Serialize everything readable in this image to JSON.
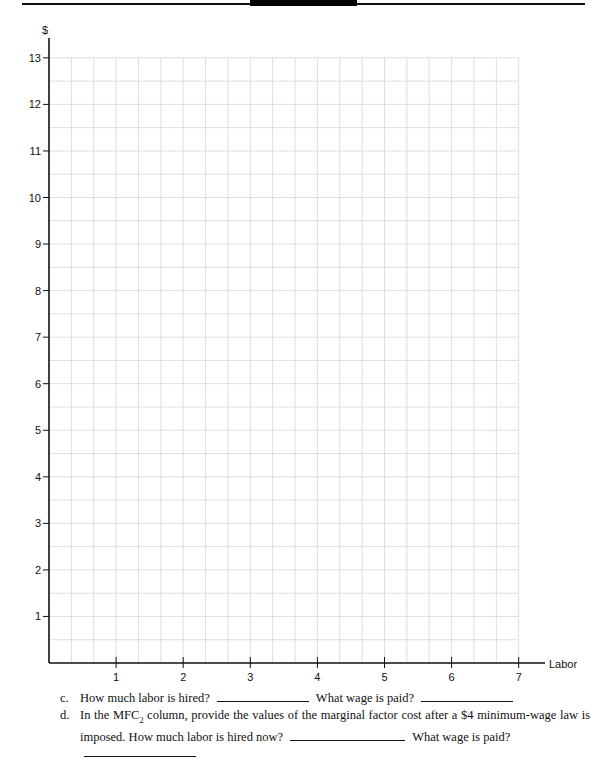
{
  "chart_data": {
    "type": "line",
    "title": "",
    "xlabel": "Labor",
    "ylabel": "$",
    "xlim": [
      0,
      7
    ],
    "ylim": [
      0,
      13
    ],
    "x_ticks": [
      "1",
      "2",
      "3",
      "4",
      "5",
      "6",
      "7"
    ],
    "y_ticks": [
      "1",
      "2",
      "3",
      "4",
      "5",
      "6",
      "7",
      "8",
      "9",
      "10",
      "11",
      "12",
      "13"
    ],
    "grid": true,
    "grid_minor_x": 0.3333,
    "grid_minor_y": 0.5,
    "series": []
  },
  "questions": {
    "c": {
      "letter": "c.",
      "text1": "How much labor is hired?",
      "text2": "What wage is paid?"
    },
    "d": {
      "letter": "d.",
      "line1_a": "In the MFC",
      "line1_sub": "2",
      "line1_b": " column, provide the values of the marginal factor cost after a $4 minimum-wage law is",
      "line2_a": "imposed. How much labor is hired now?",
      "line2_b": "What wage is paid?"
    }
  }
}
